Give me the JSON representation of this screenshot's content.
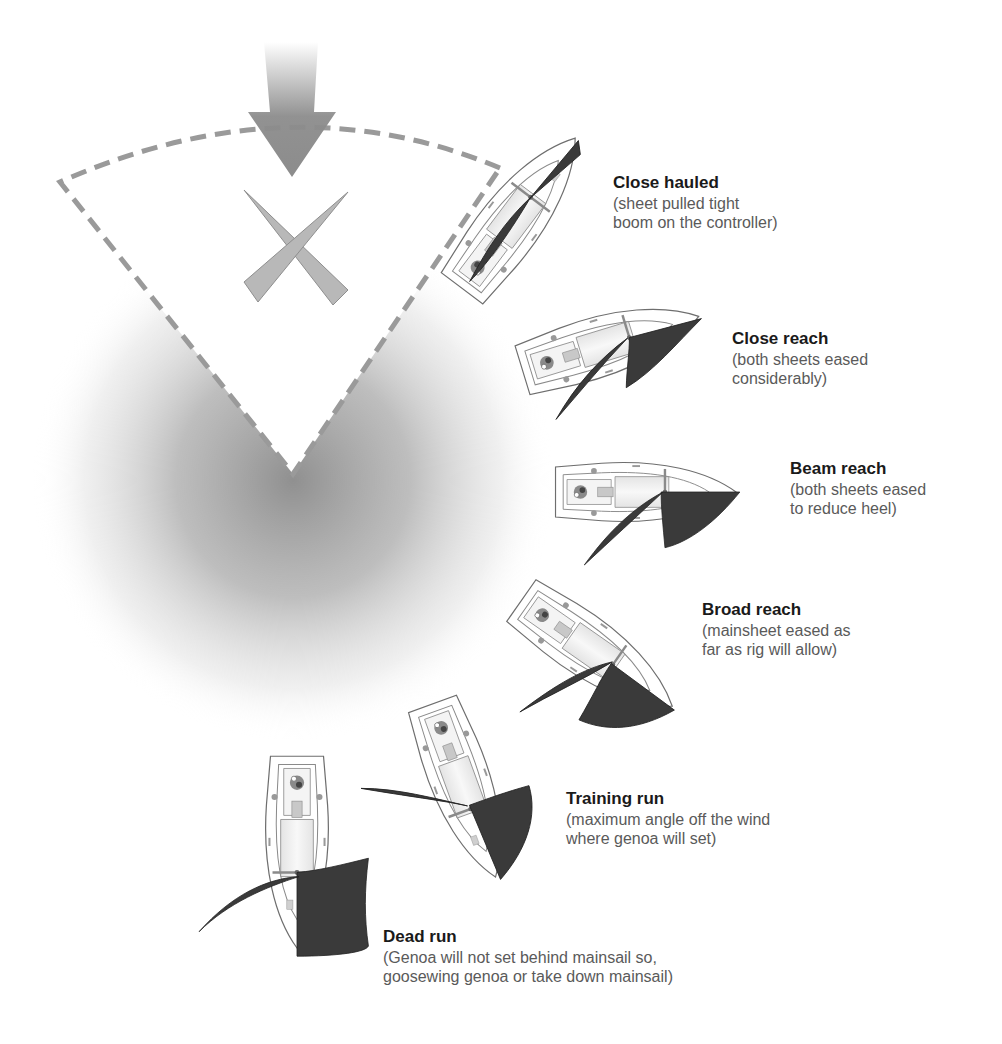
{
  "diagram": {
    "type": "points-of-sail",
    "colors": {
      "background": "#ffffff",
      "dashed_line": "#9a9a9a",
      "wind_arrow": "#8c8c8c",
      "no_go_sails": "#b3b3b3",
      "shadow": "#8a8a8a",
      "hull_outline": "#6e6e6e",
      "hull_fill": "#ffffff",
      "deck_fill": "#f1f1f1",
      "sail_fill": "#3a3a3a",
      "title_text": "#1a1a1a",
      "desc_text": "#5a5a5a"
    },
    "wind": {
      "icon": "wind-arrow-down",
      "direction": "from top"
    },
    "no_go_zone": {
      "icon": "crossed-sails-x",
      "boundary": "dashed wedge"
    },
    "points": [
      {
        "id": "close-hauled",
        "title": "Close hauled",
        "desc": "(sheet pulled tight\nboom on the controller)",
        "pos": [
          613,
          172
        ]
      },
      {
        "id": "close-reach",
        "title": "Close reach",
        "desc": "(both sheets eased\nconsiderably)",
        "pos": [
          732,
          328
        ]
      },
      {
        "id": "beam-reach",
        "title": "Beam reach",
        "desc": "(both sheets eased\nto reduce heel)",
        "pos": [
          790,
          458
        ]
      },
      {
        "id": "broad-reach",
        "title": "Broad reach",
        "desc": "(mainsheet eased as\nfar as rig will allow)",
        "pos": [
          702,
          599
        ]
      },
      {
        "id": "training-run",
        "title": "Training run",
        "desc": "(maximum angle off the wind\nwhere genoa will set)",
        "pos": [
          566,
          788
        ]
      },
      {
        "id": "dead-run",
        "title": "Dead run",
        "desc": "(Genoa will not set behind mainsail so,\ngoosewing genoa or take down mainsail)",
        "pos": [
          383,
          926
        ]
      }
    ]
  }
}
